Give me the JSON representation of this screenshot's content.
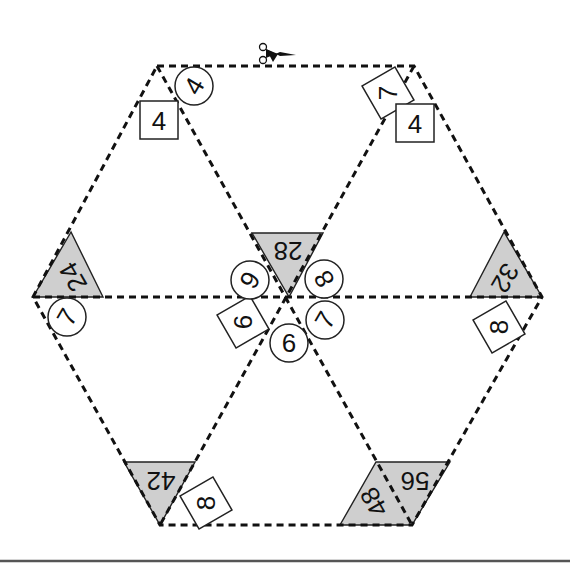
{
  "puzzle": {
    "type": "hexagon triangle multiplication puzzle (cut-out)",
    "scissors_icon": "scissors-icon",
    "center_triangle": {
      "product": "28"
    },
    "edge_triangles": [
      {
        "position": "left",
        "product": "24"
      },
      {
        "position": "right",
        "product": "32"
      },
      {
        "position": "bottom-left",
        "product": "42"
      },
      {
        "position": "bottom-right-a",
        "product": "48"
      },
      {
        "position": "bottom-right-b",
        "product": "56"
      }
    ],
    "circles": [
      {
        "position": "top-left",
        "value": "4"
      },
      {
        "position": "center-upper-left",
        "value": "6"
      },
      {
        "position": "center-upper-right",
        "value": "8"
      },
      {
        "position": "center-right",
        "value": "7"
      },
      {
        "position": "center-bottom",
        "value": "6"
      },
      {
        "position": "left",
        "value": "7"
      }
    ],
    "squares": [
      {
        "position": "top-left",
        "value": "4"
      },
      {
        "position": "top-right-rotated",
        "value": "7"
      },
      {
        "position": "top-right",
        "value": "4"
      },
      {
        "position": "center-left",
        "value": "6"
      },
      {
        "position": "right",
        "value": "8"
      },
      {
        "position": "bottom-left",
        "value": "8"
      }
    ]
  }
}
